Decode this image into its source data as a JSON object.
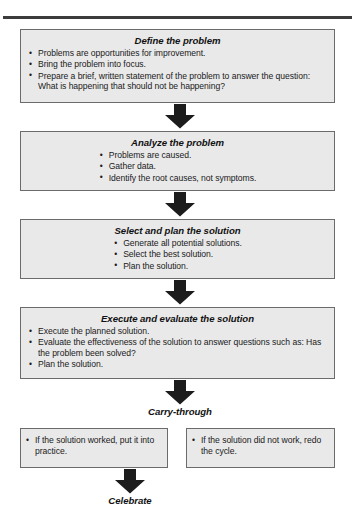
{
  "diagram": {
    "title_rule": "horizontal-rule",
    "steps": [
      {
        "id": "define",
        "title": "Define the problem",
        "bullets": [
          "Problems are opportunities for improvement.",
          "Bring the problem into focus.",
          "Prepare a brief, written statement of the problem to answer the question: What is happening that should not be happening?"
        ]
      },
      {
        "id": "analyze",
        "title": "Analyze the problem",
        "bullets": [
          "Problems are caused.",
          "Gather data.",
          "Identify the root causes, not symptoms."
        ]
      },
      {
        "id": "select",
        "title": "Select and plan the solution",
        "bullets": [
          "Generate all potential solutions.",
          "Select the best solution.",
          "Plan the solution."
        ]
      },
      {
        "id": "execute",
        "title": "Execute and evaluate the solution",
        "bullets": [
          "Execute the planned solution.",
          "Evaluate the effectiveness of the solution to answer questions such as: Has the problem been solved?",
          "Plan the solution."
        ]
      }
    ],
    "carry_through_label": "Carry-through",
    "outcomes": [
      {
        "id": "worked",
        "text": "If the solution worked, put it into practice."
      },
      {
        "id": "did-not-work",
        "text": "If the solution did not work, redo the cycle."
      }
    ],
    "celebrate_label": "Celebrate",
    "colors": {
      "box_fill": "#e9e9e9",
      "box_border": "#6b6b6b",
      "arrow": "#1c1c1c",
      "rule": "#3c3c3c",
      "text": "#1a1a1a"
    }
  }
}
